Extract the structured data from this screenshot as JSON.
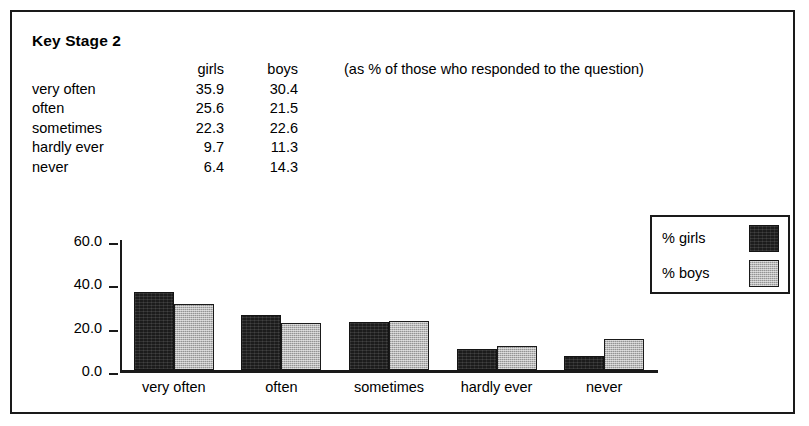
{
  "title": "Key Stage 2",
  "note": "(as % of those who responded to the question)",
  "table": {
    "header_blank": "",
    "columns": [
      "girls",
      "boys"
    ],
    "rows": [
      {
        "label": "very often",
        "girls": "35.9",
        "boys": "30.4"
      },
      {
        "label": "often",
        "girls": "25.6",
        "boys": "21.5"
      },
      {
        "label": "sometimes",
        "girls": "22.3",
        "boys": "22.6"
      },
      {
        "label": "hardly ever",
        "girls": "9.7",
        "boys": "11.3"
      },
      {
        "label": "never",
        "girls": "6.4",
        "boys": "14.3"
      }
    ]
  },
  "legend": {
    "items": [
      {
        "label": "% girls",
        "color": "#1c1c1c"
      },
      {
        "label": "% boys",
        "color": "#b8b8b8"
      }
    ]
  },
  "axis": {
    "y_ticks": [
      "60.0",
      "40.0",
      "20.0",
      "0.0"
    ]
  },
  "chart_data": {
    "type": "bar",
    "title": "Key Stage 2",
    "subtitle": "(as % of those who responded to the question)",
    "categories": [
      "very often",
      "often",
      "sometimes",
      "hardly ever",
      "never"
    ],
    "series": [
      {
        "name": "% girls",
        "values": [
          35.9,
          25.6,
          22.3,
          9.7,
          6.4
        ],
        "color": "#1c1c1c"
      },
      {
        "name": "% boys",
        "values": [
          30.4,
          21.5,
          22.6,
          11.3,
          14.3
        ],
        "color": "#b8b8b8"
      }
    ],
    "xlabel": "",
    "ylabel": "",
    "ylim": [
      0,
      60
    ],
    "yticks": [
      0,
      20,
      40,
      60
    ],
    "ytick_labels": [
      "0.0",
      "20.0",
      "40.0",
      "60.0"
    ],
    "grid": false,
    "legend_position": "right"
  }
}
